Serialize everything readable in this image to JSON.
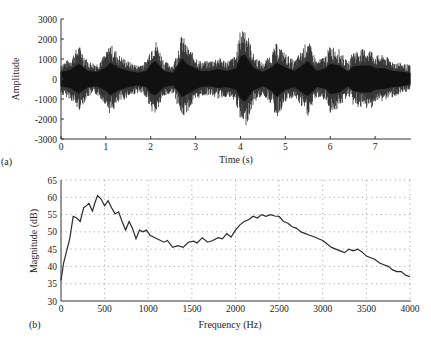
{
  "figure": {
    "panel_a_label": "(a)",
    "panel_b_label": "(b)"
  },
  "chart_data": [
    {
      "type": "line",
      "panel": "(a)",
      "title": "",
      "xlabel": "Time (s)",
      "ylabel": "Amplitude",
      "xlim": [
        0,
        7.8
      ],
      "ylim": [
        -3000,
        3000
      ],
      "xticks": [
        0,
        1,
        2,
        3,
        4,
        5,
        6,
        7
      ],
      "yticks": [
        -3000,
        -2000,
        -1000,
        0,
        1000,
        2000,
        3000
      ],
      "grid": false,
      "description": "Speech waveform; dense oscillation around 0 with bursts",
      "envelope": {
        "t": [
          0.0,
          0.2,
          0.4,
          0.6,
          0.8,
          1.0,
          1.1,
          1.3,
          1.5,
          1.7,
          1.9,
          2.0,
          2.1,
          2.3,
          2.5,
          2.7,
          2.8,
          2.9,
          3.1,
          3.3,
          3.5,
          3.7,
          3.9,
          4.0,
          4.1,
          4.3,
          4.5,
          4.7,
          4.8,
          5.0,
          5.2,
          5.35,
          5.5,
          5.7,
          5.9,
          6.0,
          6.2,
          6.4,
          6.5,
          6.7,
          6.9,
          7.0,
          7.2,
          7.4,
          7.6,
          7.78
        ],
        "upper": [
          800,
          1000,
          1700,
          900,
          800,
          1300,
          1800,
          1200,
          900,
          700,
          900,
          1600,
          2000,
          900,
          700,
          2300,
          1700,
          1400,
          900,
          900,
          1100,
          900,
          1200,
          2500,
          2700,
          1200,
          800,
          1300,
          1800,
          1300,
          900,
          1400,
          2000,
          900,
          1200,
          1700,
          1500,
          800,
          1400,
          1500,
          1500,
          1200,
          1200,
          900,
          800,
          700
        ],
        "lower": [
          -800,
          -1000,
          -1600,
          -900,
          -800,
          -1300,
          -1800,
          -1200,
          -900,
          -700,
          -900,
          -1600,
          -1800,
          -900,
          -700,
          -2000,
          -1700,
          -1400,
          -900,
          -800,
          -1000,
          -900,
          -1200,
          -2200,
          -2500,
          -1200,
          -800,
          -1300,
          -2000,
          -1200,
          -900,
          -1400,
          -1900,
          -900,
          -1100,
          -1700,
          -1500,
          -800,
          -1300,
          -1500,
          -1500,
          -1200,
          -1100,
          -900,
          -800,
          -600
        ]
      }
    },
    {
      "type": "line",
      "panel": "(b)",
      "title": "",
      "xlabel": "Frequency (Hz)",
      "ylabel": "Magnitude (dB)",
      "xlim": [
        0,
        4000
      ],
      "ylim": [
        30,
        65
      ],
      "xticks": [
        0,
        500,
        1000,
        1500,
        2000,
        2500,
        3000,
        3500,
        4000
      ],
      "yticks": [
        30,
        35,
        40,
        45,
        50,
        55,
        60,
        65
      ],
      "grid": true,
      "x": [
        0,
        30,
        60,
        100,
        140,
        180,
        220,
        260,
        290,
        320,
        360,
        390,
        420,
        460,
        500,
        540,
        580,
        620,
        660,
        700,
        740,
        780,
        820,
        860,
        900,
        940,
        980,
        1020,
        1100,
        1180,
        1220,
        1280,
        1340,
        1400,
        1460,
        1520,
        1560,
        1620,
        1680,
        1740,
        1800,
        1850,
        1900,
        1950,
        2000,
        2050,
        2100,
        2150,
        2200,
        2250,
        2300,
        2350,
        2400,
        2450,
        2500,
        2550,
        2600,
        2650,
        2700,
        2750,
        2800,
        2850,
        2900,
        2950,
        3000,
        3050,
        3100,
        3150,
        3200,
        3250,
        3300,
        3350,
        3400,
        3450,
        3500,
        3550,
        3600,
        3650,
        3700,
        3750,
        3800,
        3850,
        3900,
        3950,
        4000
      ],
      "values": [
        36,
        41,
        44,
        48,
        54.5,
        54,
        53,
        57,
        57.5,
        58.3,
        56,
        58.5,
        60.5,
        59.5,
        57.5,
        59,
        57,
        55.2,
        55.8,
        53,
        50.5,
        53,
        51,
        48,
        50.5,
        50,
        50.5,
        49,
        48,
        47,
        47.5,
        45.5,
        46,
        45.5,
        47,
        47.3,
        46.8,
        48.3,
        47,
        47.5,
        48.3,
        48,
        49.5,
        48.5,
        50.5,
        52,
        53,
        53.5,
        54.5,
        54,
        55,
        54.5,
        55,
        54.6,
        54.5,
        53,
        52.5,
        51.5,
        51,
        50,
        49.5,
        49,
        48.6,
        48,
        47.5,
        46.5,
        45.5,
        45,
        44.5,
        44,
        45,
        44.5,
        45,
        44.2,
        43,
        42.5,
        42,
        41,
        40.5,
        40,
        39,
        38.5,
        38.5,
        37.5,
        37
      ]
    }
  ]
}
